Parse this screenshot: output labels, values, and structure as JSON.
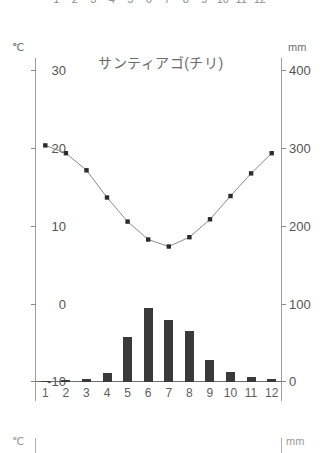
{
  "figure": {
    "title": "サンティアゴ(チリ)",
    "left_unit": "℃",
    "right_unit": "mm"
  },
  "neighbor_top": {
    "months": [
      "1",
      "2",
      "3",
      "4",
      "5",
      "6",
      "7",
      "8",
      "9",
      "10",
      "11",
      "12"
    ]
  },
  "neighbor_bottom": {
    "left_unit": "℃",
    "right_unit": "mm"
  },
  "axes": {
    "temp_ticks": [
      "30",
      "20",
      "10",
      "0",
      "-10"
    ],
    "precip_ticks": [
      "400",
      "300",
      "200",
      "100",
      "0"
    ],
    "months": [
      "1",
      "2",
      "3",
      "4",
      "5",
      "6",
      "7",
      "8",
      "9",
      "10",
      "11",
      "12"
    ]
  },
  "colors": {
    "bar": "#3a3a3a",
    "line": "#8a8a8a",
    "marker": "#2b2b2b",
    "axis": "#9e9e9e",
    "text": "#555555"
  },
  "chart_data": {
    "type": "bar",
    "title": "サンティアゴ(チリ)",
    "subtitle": "",
    "categories": [
      "1",
      "2",
      "3",
      "4",
      "5",
      "6",
      "7",
      "8",
      "9",
      "10",
      "11",
      "12"
    ],
    "xlabel": "",
    "ylabel": "℃",
    "y2label": "mm",
    "ylim": [
      -10,
      30
    ],
    "y2lim": [
      0,
      400
    ],
    "yticks": [
      -10,
      0,
      10,
      20,
      30
    ],
    "y2ticks": [
      0,
      100,
      200,
      300,
      400
    ],
    "grid": false,
    "legend": "none",
    "series": [
      {
        "name": "降水量",
        "type": "bar",
        "axis": "right",
        "unit": "mm",
        "values": [
          1,
          2,
          4,
          12,
          58,
          95,
          80,
          65,
          28,
          13,
          7,
          4
        ]
      },
      {
        "name": "気温",
        "type": "line",
        "axis": "left",
        "unit": "℃",
        "values": [
          20.3,
          19.3,
          17.1,
          13.6,
          10.5,
          8.2,
          7.3,
          8.5,
          10.8,
          13.8,
          16.7,
          19.3
        ]
      }
    ]
  }
}
